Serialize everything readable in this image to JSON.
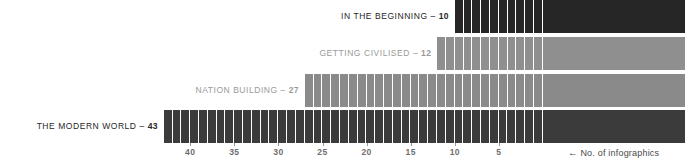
{
  "chart_data": {
    "type": "bar",
    "orientation": "horizontal",
    "direction": "right-to-left",
    "title": "",
    "subtitle": "",
    "xlabel": "No. of infographics",
    "ylabel": "",
    "axis_caption": "← No. of infographics",
    "axis_arrow": "←",
    "axis_caption_text": "No. of infographics",
    "grid": false,
    "legend": false,
    "xlim": [
      0,
      43
    ],
    "tick_labels": [
      "40",
      "35",
      "30",
      "25",
      "20",
      "15",
      "10",
      "5"
    ],
    "tick_values": [
      40,
      35,
      30,
      25,
      20,
      15,
      10,
      5
    ],
    "categories": [
      "IN THE BEGINNING",
      "GETTING CIVILISED",
      "NATION BUILDING",
      "THE MODERN WORLD"
    ],
    "values": [
      10,
      12,
      27,
      43
    ],
    "series": [
      {
        "name": "No. of infographics",
        "values": [
          10,
          12,
          27,
          43
        ]
      }
    ],
    "bars": [
      {
        "label": "IN THE BEGINNING",
        "value": 10,
        "value_text": "10",
        "separator": "–",
        "color": "#262626",
        "segments": 10
      },
      {
        "label": "GETTING CIVILISED",
        "value": 12,
        "value_text": "12",
        "separator": "–",
        "color": "#8f8f8f",
        "segments": 12
      },
      {
        "label": "NATION BUILDING",
        "value": 27,
        "value_text": "27",
        "separator": "–",
        "color": "#8a8a8a",
        "segments": 27
      },
      {
        "label": "THE MODERN WORLD",
        "value": 43,
        "value_text": "43",
        "separator": "–",
        "color": "#3b3b3b",
        "segments": 43
      }
    ],
    "colors": {
      "background": "#ffffff",
      "bar_dark": "#262626",
      "bar_charcoal": "#3b3b3b",
      "bar_gray": "#8a8a8a",
      "label_dark": "#262626",
      "label_gray": "#9a9a9a",
      "axis_tick": "#9a9a9a",
      "axis_text": "#6e6e6e",
      "caption_text": "#4a4a4a",
      "segment_divider": "#ffffff"
    }
  }
}
